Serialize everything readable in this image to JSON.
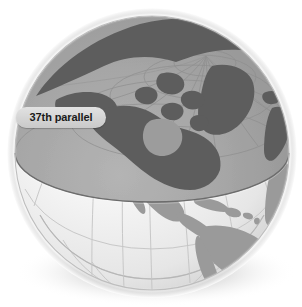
{
  "figure": {
    "background_color": "#ffffff",
    "width": 302,
    "height": 307
  },
  "callout": {
    "label": "37th parallel",
    "shape": "rounded-pill",
    "fill_color": "#d8d8d8",
    "text_color": "#1a1a1a"
  },
  "globe": {
    "center_x": 152,
    "center_y": 153,
    "radius": 137,
    "projection": "orthographic",
    "center_view": "North America",
    "colors": {
      "ocean_lit": "#f1f1f1",
      "ocean_shaded": "#9d9d9d",
      "land_lit": "#9a9a9a",
      "land_shaded": "#5f5f5f",
      "graticule_lit": "#c8c8c8",
      "graticule_shaded": "#8a8a8a",
      "terminator_line": "#6f6f6f",
      "limb_edge": "#b5b5b5",
      "drop_shadow": "#bfbfbf"
    },
    "shading": {
      "description": "Region north of the 37th parallel rendered in darker tone",
      "boundary_label": "37th parallel",
      "boundary_latitude": 37
    },
    "graticule": {
      "parallel_spacing_degrees": 15,
      "meridian_spacing_degrees": 15,
      "visible": true
    },
    "landmasses": [
      "North America",
      "Greenland",
      "Canadian Arctic Archipelago",
      "Alaska",
      "Mexico",
      "Central America",
      "Caribbean Islands",
      "South America",
      "Iceland",
      "Northwest Africa"
    ]
  },
  "shadow": {
    "visible": true,
    "position": "beneath-globe",
    "color": "#c4c4c4"
  }
}
